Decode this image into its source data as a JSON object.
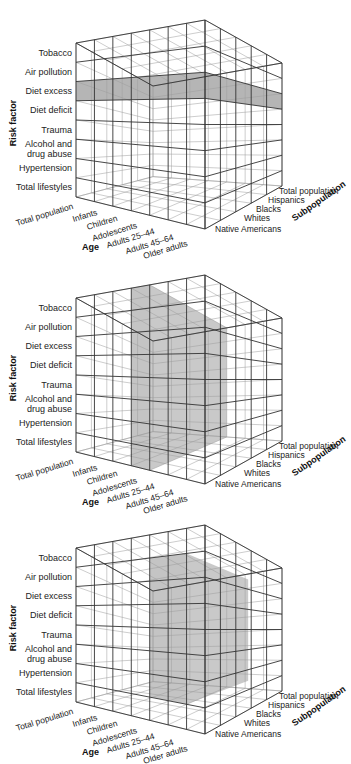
{
  "figure": {
    "axes": {
      "risk_factor_title": "Risk factor",
      "age_title": "Age",
      "subpopulation_title": "Subpopulation"
    },
    "risk_factors": [
      "Tobacco",
      "Air pollution",
      "Diet excess",
      "Diet deficit",
      "Trauma",
      "Alcohol and",
      "drug abuse",
      "Hypertension",
      "Total lifestyles"
    ],
    "risk_factor_rows": [
      "Tobacco",
      "Air pollution",
      "Diet excess",
      "Diet deficit",
      "Trauma",
      "Alcohol and drug abuse",
      "Hypertension",
      "Total lifestyles"
    ],
    "ages": [
      "Total population",
      "Infants",
      "Children",
      "Adolescents",
      "Adults 25–44",
      "Adults 45–64",
      "Older adults"
    ],
    "subpopulations": [
      "Total population",
      "Hispanics",
      "Blacks",
      "Whites",
      "Native Americans"
    ],
    "colors": {
      "grid": "#333333",
      "grid_light": "#9a9a9a",
      "highlight": "#9c9c9c",
      "highlight_alpha": "0.75"
    }
  },
  "panels": [
    {
      "id": "cube-1",
      "highlight": "Diet excess (all ages, all subpopulations)",
      "highlight_type": "row",
      "row_index": 2
    },
    {
      "id": "cube-2",
      "highlight": "Adolescents (all risk factors, all subpopulations)",
      "highlight_type": "column",
      "col_index": 3
    },
    {
      "id": "cube-3",
      "highlight": "Sub-block: Adults 25–44 to Adults 45–64, Air pollution to Hypertension",
      "highlight_type": "block",
      "col_range": [
        4,
        6
      ],
      "row_range": [
        1,
        7
      ],
      "depth_range": [
        0,
        4
      ]
    }
  ]
}
